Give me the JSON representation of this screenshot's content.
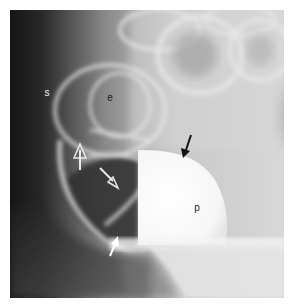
{
  "figure": {
    "labels": [
      {
        "id": "s",
        "text": "s",
        "x": 47,
        "y": 93
      },
      {
        "id": "e",
        "text": "e",
        "x": 110,
        "y": 98
      },
      {
        "id": "p",
        "text": "p",
        "x": 197,
        "y": 208
      }
    ],
    "arrows": [
      {
        "name": "open-arrow-up",
        "style": "open-head",
        "color": "#e8e8e8"
      },
      {
        "name": "open-arrow-diagonal",
        "style": "open-head",
        "color": "#e8e8e8"
      },
      {
        "name": "white-arrow",
        "style": "solid-head",
        "color": "#ffffff"
      },
      {
        "name": "black-arrow",
        "style": "solid-head",
        "color": "#111111"
      }
    ],
    "colors": {
      "border": "#ffffff",
      "dark_region": "#1c1c1c",
      "contrast_fill": "#fbfbfb"
    }
  }
}
